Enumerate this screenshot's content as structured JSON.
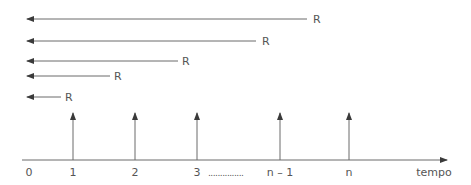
{
  "diagram": {
    "type": "cash-flow timeline",
    "colors": {
      "line": "#6a6a6a",
      "text": "#555555",
      "background": "#ffffff"
    },
    "backward_arrows": [
      {
        "label": "R",
        "y": 19,
        "x_start": 27,
        "x_end": 307,
        "label_x": 313
      },
      {
        "label": "R",
        "y": 41,
        "x_start": 27,
        "x_end": 256,
        "label_x": 262
      },
      {
        "label": "R",
        "y": 61,
        "x_start": 27,
        "x_end": 178,
        "label_x": 182
      },
      {
        "label": "R",
        "y": 76,
        "x_start": 27,
        "x_end": 110,
        "label_x": 114
      },
      {
        "label": "R",
        "y": 97,
        "x_start": 27,
        "x_end": 61,
        "label_x": 65
      }
    ],
    "axis": {
      "y": 160,
      "x_start": 22,
      "x_end": 447,
      "label": "tempo"
    },
    "payment_arrows": [
      {
        "x": 73,
        "y_top": 113
      },
      {
        "x": 135,
        "y_top": 113
      },
      {
        "x": 197,
        "y_top": 113
      },
      {
        "x": 280,
        "y_top": 113
      },
      {
        "x": 349,
        "y_top": 113
      }
    ],
    "tick_labels": [
      {
        "text": "0",
        "x": 29
      },
      {
        "text": "1",
        "x": 73
      },
      {
        "text": "2",
        "x": 135
      },
      {
        "text": "3",
        "x": 197
      },
      {
        "text": "n – 1",
        "x": 280
      },
      {
        "text": "n",
        "x": 349
      }
    ],
    "ellipsis": "...............",
    "axis_label": "tempo"
  }
}
